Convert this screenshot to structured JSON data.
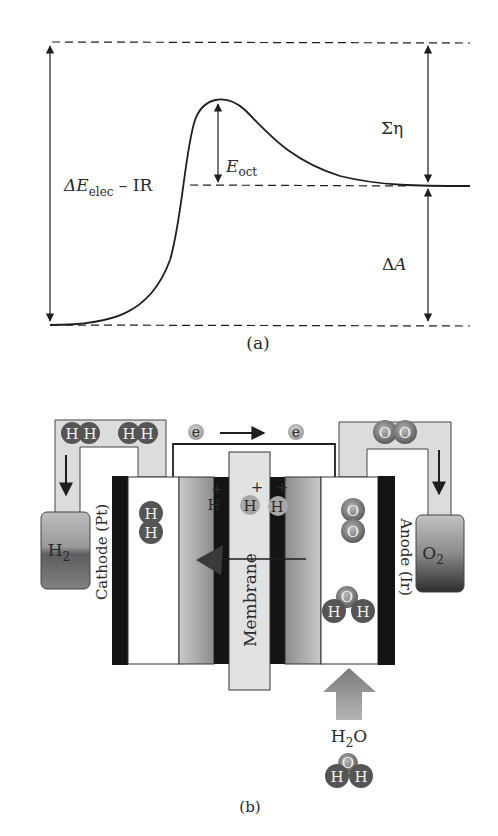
{
  "panel_a": {
    "caption": "(a)",
    "labels": {
      "delta_e_prefix": "ΔE",
      "delta_e_sub": "elec",
      "delta_e_suffix": " – IR",
      "e_oct_main": "E",
      "e_oct_sub": "oct",
      "sigma_eta": "Ση",
      "delta_a_prefix": "Δ",
      "delta_a_main": "A"
    }
  },
  "panel_b": {
    "caption": "(b)",
    "cathode_label": "Cathode (Pt)",
    "anode_label": "Anode (Ir)",
    "membrane_label": "Membrane",
    "h2_tank": {
      "main": "H",
      "sub": "2"
    },
    "o2_tank": {
      "main": "O",
      "sub": "2"
    },
    "water_input": {
      "h": "H",
      "sub": "2",
      "o": "O"
    },
    "electron": "e",
    "proton": "H",
    "proton_charge": "+",
    "atom_h": "H",
    "atom_o": "O"
  },
  "colors": {
    "line": "#1e1e1e",
    "electrode": "#141414",
    "molecule_dark": "#555555",
    "molecule_light": "#9a9a9a",
    "pipe_fill": "#dcdcdc",
    "membrane_fill": "#e2e2e2"
  }
}
